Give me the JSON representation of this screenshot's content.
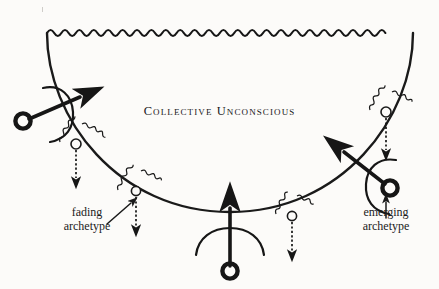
{
  "figure": {
    "kind": "conceptual-diagram",
    "title": "Collective Unconscious",
    "background_color": "#fcfbf9",
    "ink_color": "#1a1a1a",
    "canvas": {
      "width": 439,
      "height": 289
    }
  },
  "labels": {
    "title": "Collective Unconscious",
    "fading": {
      "line1": "fading",
      "line2": "archetype"
    },
    "emerging": {
      "line1": "emerging",
      "line2": "archetype"
    }
  },
  "icons": {
    "wavy_boundary": "wavy-line-icon",
    "bowl_curve": "arc-curve-icon",
    "archetype_node": "small-circle-node-icon",
    "squiggle_aura": "squiggle-aura-icon",
    "dotted_down_arrow": "dotted-down-arrow-icon",
    "ring_arrow": "ring-tailed-arrow-icon",
    "rotation_arc": "rotation-arc-icon",
    "pointer_arrow": "pointer-arrow-icon"
  },
  "elements": {
    "archetype_nodes": [
      {
        "name": "archetype-node-1",
        "cx": 76,
        "cy": 144,
        "state": "fading"
      },
      {
        "name": "archetype-node-2",
        "cx": 136,
        "cy": 191,
        "state": "fading"
      },
      {
        "name": "archetype-node-3",
        "cx": 292,
        "cy": 216,
        "state": "fading"
      },
      {
        "name": "archetype-node-4",
        "cx": 386,
        "cy": 112,
        "state": "fading"
      }
    ],
    "ring_arrows": [
      {
        "name": "ring-arrow-left",
        "direction": "up-right"
      },
      {
        "name": "ring-arrow-bottom",
        "direction": "up"
      },
      {
        "name": "ring-arrow-right",
        "direction": "up-left"
      }
    ]
  }
}
